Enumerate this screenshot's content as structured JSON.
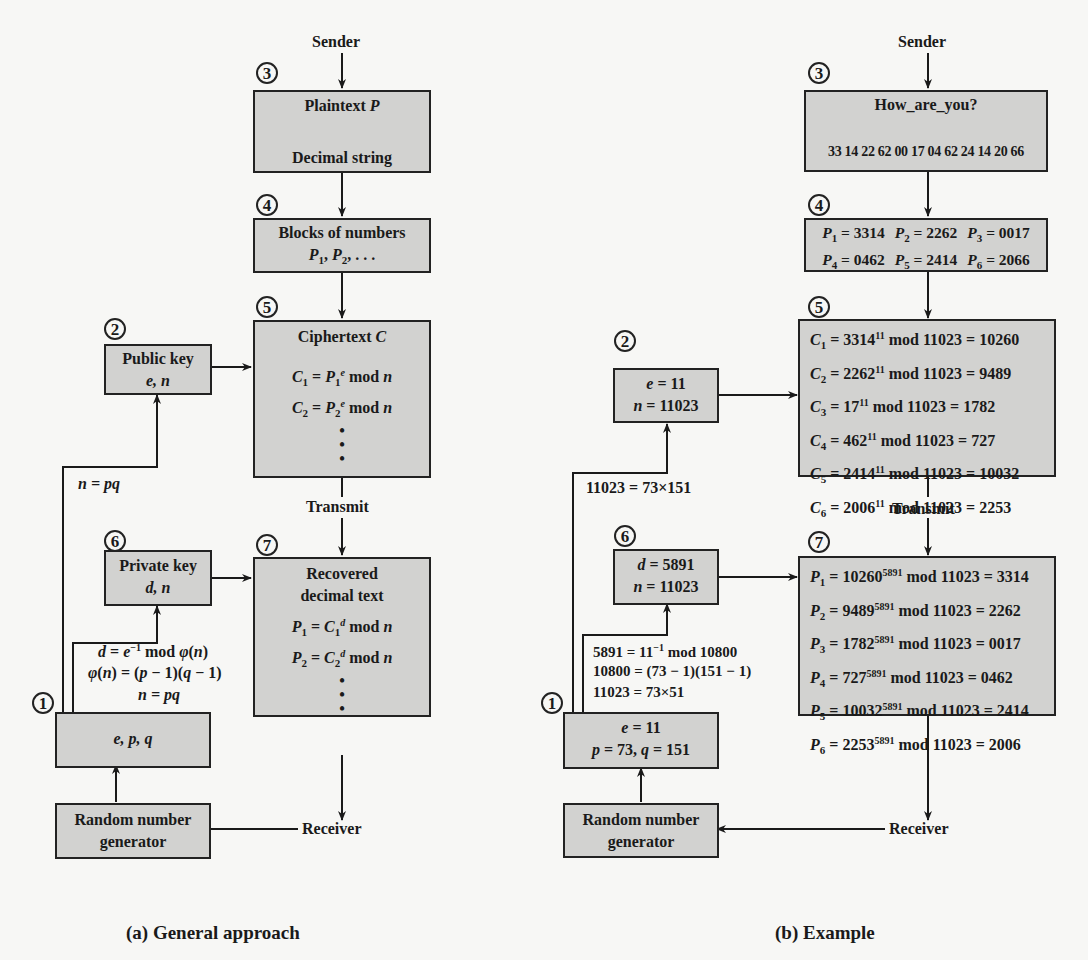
{
  "general": {
    "sender": "Sender",
    "receiver": "Receiver",
    "transmit": "Transmit",
    "steps": [
      "1",
      "2",
      "3",
      "4",
      "5",
      "6",
      "7"
    ],
    "plaintext_title": "Plaintext",
    "plaintext_var": "P",
    "decimal_string": "Decimal string",
    "blocks_title": "Blocks of numbers",
    "blocks_vars": "P1, P2, . . .",
    "cipher_title": "Ciphertext",
    "cipher_var": "C",
    "cipher_lines": [
      "C1 = P1^e mod n",
      "C2 = P2^e mod n"
    ],
    "public_key_title": "Public key",
    "public_key_vars": "e, n",
    "n_eq_pq": "n = pq",
    "private_key_title": "Private key",
    "private_key_vars": "d, n",
    "derivation": [
      "d = e^-1 mod φ(n)",
      "φ(n) = (p − 1)(q − 1)",
      "n = pq"
    ],
    "params": "e, p, q",
    "recovered_title_1": "Recovered",
    "recovered_title_2": "decimal text",
    "recovered_lines": [
      "P1 = C1^d mod n",
      "P2 = C2^d mod n"
    ],
    "rng_1": "Random number",
    "rng_2": "generator",
    "caption": "(a) General approach"
  },
  "example": {
    "sender": "Sender",
    "receiver": "Receiver",
    "transmit": "Transmit",
    "message": "How_are_you?",
    "codes": [
      "33",
      "14",
      "22",
      "62",
      "00",
      "17",
      "04",
      "62",
      "24",
      "14",
      "20",
      "66"
    ],
    "blocks": [
      {
        "name": "P",
        "sub": "1",
        "val": "3314"
      },
      {
        "name": "P",
        "sub": "2",
        "val": "2262"
      },
      {
        "name": "P",
        "sub": "3",
        "val": "0017"
      },
      {
        "name": "P",
        "sub": "4",
        "val": "0462"
      },
      {
        "name": "P",
        "sub": "5",
        "val": "2414"
      },
      {
        "name": "P",
        "sub": "6",
        "val": "2066"
      }
    ],
    "cipher": [
      {
        "sub": "1",
        "base": "3314",
        "exp": "11",
        "mod": "11023",
        "res": "10260"
      },
      {
        "sub": "2",
        "base": "2262",
        "exp": "11",
        "mod": "11023",
        "res": "9489"
      },
      {
        "sub": "3",
        "base": "17",
        "exp": "11",
        "mod": "11023",
        "res": "1782"
      },
      {
        "sub": "4",
        "base": "462",
        "exp": "11",
        "mod": "11023",
        "res": "727"
      },
      {
        "sub": "5",
        "base": "2414",
        "exp": "11",
        "mod": "11023",
        "res": "10032"
      },
      {
        "sub": "6",
        "base": "2006",
        "exp": "11",
        "mod": "11023",
        "res": "2253"
      }
    ],
    "public_key": [
      "e = 11",
      "n = 11023"
    ],
    "n_factor": "11023 = 73×151",
    "private_key": [
      "d = 5891",
      "n = 11023"
    ],
    "derivation": [
      "5891 = 11^-1 mod 10800",
      "10800 = (73 − 1)(151 − 1)",
      "11023 = 73×51"
    ],
    "params": [
      "e = 11",
      "p = 73, q = 151"
    ],
    "recovered": [
      {
        "sub": "1",
        "base": "10260",
        "exp": "5891",
        "mod": "11023",
        "res": "3314"
      },
      {
        "sub": "2",
        "base": "9489",
        "exp": "5891",
        "mod": "11023",
        "res": "2262"
      },
      {
        "sub": "3",
        "base": "1782",
        "exp": "5891",
        "mod": "11023",
        "res": "0017"
      },
      {
        "sub": "4",
        "base": "727",
        "exp": "5891",
        "mod": "11023",
        "res": "0462"
      },
      {
        "sub": "5",
        "base": "10032",
        "exp": "5891",
        "mod": "11023",
        "res": "2414"
      },
      {
        "sub": "6",
        "base": "2253",
        "exp": "5891",
        "mod": "11023",
        "res": "2006"
      }
    ],
    "rng_1": "Random number",
    "rng_2": "generator",
    "caption": "(b) Example"
  }
}
